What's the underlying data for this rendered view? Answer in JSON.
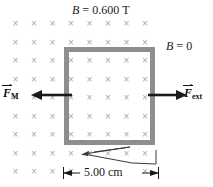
{
  "figure": {
    "background_color": "#ffffff"
  },
  "field": {
    "symbol": "×",
    "symbol_name": "field-into-page-x",
    "color": "#a8a8a8",
    "columns": 8,
    "rows": 9,
    "spacing_px": 18.5,
    "direction": "into the page"
  },
  "labels": {
    "b_field": {
      "variable": "B",
      "equals": " = ",
      "value": "0.600",
      "unit": "T",
      "full": "B = 0.600 T"
    },
    "b_zero": {
      "variable": "B",
      "equals": " = ",
      "value": "0",
      "full": "B = 0"
    },
    "dimension": {
      "value": "5.00",
      "unit": "cm",
      "full": "5.00 cm"
    },
    "force_magnetic": {
      "symbol": "F",
      "subscript": "M",
      "full": "F_M",
      "description": "magnetic force on the loop, pointing left"
    },
    "force_external": {
      "symbol": "F",
      "subscript": "ext",
      "full": "F_ext",
      "description": "external applied force, pointing right"
    }
  },
  "loop": {
    "name": "conducting-loop",
    "border_color": "#8e8e8e",
    "border_width_px": 5,
    "width_label": "5.00 cm"
  },
  "colors": {
    "loop": "#8e8e8e",
    "field_marks": "#a8a8a8",
    "arrows": "#1a1a1a",
    "text": "#111111"
  }
}
